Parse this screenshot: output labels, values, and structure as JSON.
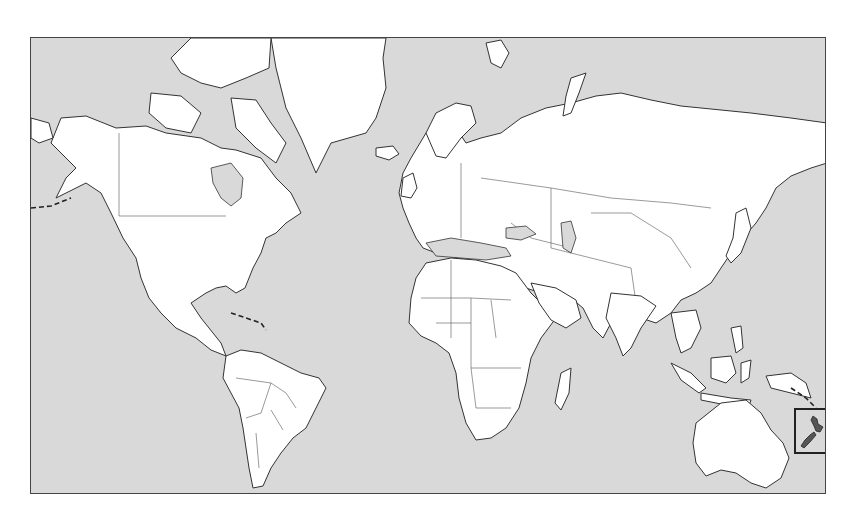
{
  "caption": {
    "text": ""
  },
  "map": {
    "projection": "world-mercator",
    "colors": {
      "ocean": "#d9d9d9",
      "land": "#ffffff",
      "outline": "#333333",
      "highlight": "#555555"
    },
    "highlighted_region": {
      "name": "New Zealand",
      "indicator": "boxed-inset"
    },
    "continents": [
      "North America",
      "Greenland",
      "South America",
      "Europe",
      "Africa",
      "Asia",
      "Australia",
      "New Zealand"
    ]
  }
}
